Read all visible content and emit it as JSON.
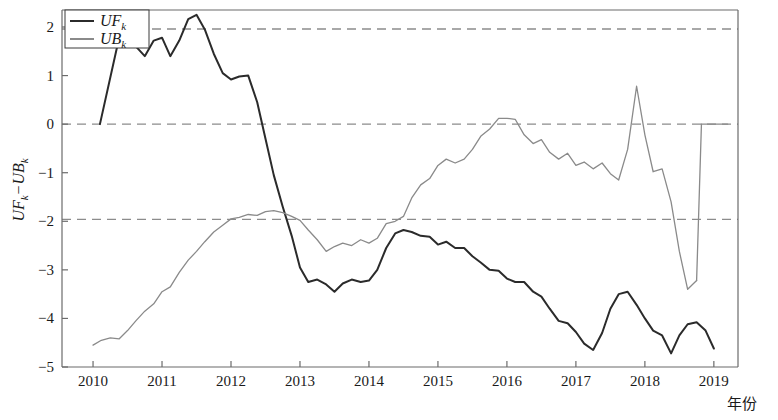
{
  "chart_data": {
    "type": "line",
    "title": "",
    "xlabel": "年份",
    "ylabel": "UFₖ−UBₖ",
    "ylabel_parts": {
      "first_main": "UF",
      "first_sub": "k",
      "dash": "−",
      "second_main": "UB",
      "second_sub": "k"
    },
    "xlim": [
      2009.55,
      2019.35
    ],
    "ylim": [
      -5,
      2.35
    ],
    "xticks": [
      2010,
      2011,
      2012,
      2013,
      2014,
      2015,
      2016,
      2017,
      2018,
      2019
    ],
    "xtick_labels": [
      "2010",
      "2011",
      "2012",
      "2013",
      "2014",
      "2015",
      "2016",
      "2017",
      "2018",
      "2019"
    ],
    "yticks": [
      2,
      1,
      0,
      -1,
      -2,
      -3,
      -4,
      -5
    ],
    "ytick_labels": [
      "2",
      "1",
      "0",
      "−1",
      "−2",
      "−3",
      "−4",
      "−5"
    ],
    "grid": false,
    "reference_lines": [
      {
        "y": 1.96,
        "style": "dashed",
        "color": "#8c8c8c",
        "label": "+1.96 significance"
      },
      {
        "y": 0,
        "style": "dashed",
        "color": "#8c8c8c",
        "label": "zero line"
      },
      {
        "y": -1.96,
        "style": "dashed",
        "color": "#8c8c8c",
        "label": "-1.96 significance"
      }
    ],
    "legend": {
      "position": "top-left",
      "entries": [
        {
          "name": "UFₖ",
          "main": "UF",
          "sub": "k",
          "color": "#2b2b2b",
          "width": 2.0
        },
        {
          "name": "UBₖ",
          "main": "UB",
          "sub": "k",
          "color": "#8a8a8a",
          "width": 1.3
        }
      ]
    },
    "series": [
      {
        "name": "UFₖ",
        "color": "#2b2b2b",
        "width": 2.0,
        "x": [
          2010.1,
          2010.35,
          2010.5,
          2010.62,
          2010.75,
          2010.88,
          2011.0,
          2011.12,
          2011.25,
          2011.38,
          2011.5,
          2011.62,
          2011.75,
          2011.88,
          2012.0,
          2012.12,
          2012.25,
          2012.38,
          2012.5,
          2012.62,
          2012.75,
          2012.88,
          2013.0,
          2013.12,
          2013.25,
          2013.38,
          2013.5,
          2013.62,
          2013.75,
          2013.88,
          2014.0,
          2014.12,
          2014.25,
          2014.38,
          2014.5,
          2014.62,
          2014.75,
          2014.88,
          2015.0,
          2015.12,
          2015.25,
          2015.38,
          2015.5,
          2015.62,
          2015.75,
          2015.88,
          2016.0,
          2016.12,
          2016.25,
          2016.38,
          2016.5,
          2016.62,
          2016.75,
          2016.88,
          2017.0,
          2017.12,
          2017.25,
          2017.38,
          2017.5,
          2017.62,
          2017.75,
          2017.88,
          2018.0,
          2018.12,
          2018.25,
          2018.38,
          2018.5,
          2018.62,
          2018.75,
          2018.88,
          2019.0
        ],
        "y": [
          0.0,
          1.6,
          2.08,
          1.6,
          1.4,
          1.72,
          1.78,
          1.4,
          1.72,
          2.16,
          2.25,
          1.95,
          1.45,
          1.05,
          0.92,
          0.98,
          1.0,
          0.45,
          -0.3,
          -1.05,
          -1.7,
          -2.3,
          -2.95,
          -3.25,
          -3.2,
          -3.3,
          -3.45,
          -3.28,
          -3.2,
          -3.25,
          -3.22,
          -3.0,
          -2.55,
          -2.25,
          -2.18,
          -2.22,
          -2.3,
          -2.32,
          -2.48,
          -2.42,
          -2.55,
          -2.55,
          -2.72,
          -2.85,
          -3.0,
          -3.02,
          -3.18,
          -3.25,
          -3.25,
          -3.45,
          -3.55,
          -3.8,
          -4.05,
          -4.1,
          -4.28,
          -4.52,
          -4.65,
          -4.3,
          -3.8,
          -3.5,
          -3.45,
          -3.72,
          -4.0,
          -4.25,
          -4.35,
          -4.72,
          -4.35,
          -4.12,
          -4.08,
          -4.25,
          -4.62
        ]
      },
      {
        "name": "UBₖ",
        "color": "#8a8a8a",
        "width": 1.3,
        "x": [
          2010.0,
          2010.12,
          2010.25,
          2010.38,
          2010.5,
          2010.62,
          2010.75,
          2010.88,
          2011.0,
          2011.12,
          2011.25,
          2011.38,
          2011.5,
          2011.62,
          2011.75,
          2011.88,
          2012.0,
          2012.12,
          2012.25,
          2012.38,
          2012.5,
          2012.62,
          2012.75,
          2012.88,
          2013.0,
          2013.12,
          2013.25,
          2013.38,
          2013.5,
          2013.62,
          2013.75,
          2013.88,
          2014.0,
          2014.12,
          2014.25,
          2014.38,
          2014.5,
          2014.62,
          2014.75,
          2014.88,
          2015.0,
          2015.12,
          2015.25,
          2015.38,
          2015.5,
          2015.62,
          2015.75,
          2015.88,
          2016.0,
          2016.12,
          2016.25,
          2016.38,
          2016.5,
          2016.62,
          2016.75,
          2016.88,
          2017.0,
          2017.12,
          2017.25,
          2017.38,
          2017.5,
          2017.62,
          2017.75,
          2017.88,
          2018.0,
          2018.12,
          2018.25,
          2018.38,
          2018.5,
          2018.62,
          2018.75
        ],
        "y": [
          -4.55,
          -4.45,
          -4.4,
          -4.42,
          -4.25,
          -4.05,
          -3.85,
          -3.7,
          -3.45,
          -3.35,
          -3.05,
          -2.8,
          -2.62,
          -2.42,
          -2.22,
          -2.08,
          -1.95,
          -1.92,
          -1.86,
          -1.88,
          -1.8,
          -1.78,
          -1.82,
          -1.9,
          -1.98,
          -2.18,
          -2.38,
          -2.62,
          -2.52,
          -2.45,
          -2.5,
          -2.38,
          -2.45,
          -2.35,
          -2.05,
          -2.0,
          -1.9,
          -1.52,
          -1.25,
          -1.12,
          -0.85,
          -0.72,
          -0.8,
          -0.72,
          -0.52,
          -0.25,
          -0.1,
          0.12,
          0.12,
          0.1,
          -0.22,
          -0.4,
          -0.32,
          -0.58,
          -0.72,
          -0.6,
          -0.85,
          -0.78,
          -0.92,
          -0.8,
          -1.02,
          -1.15,
          -0.52,
          0.78,
          -0.22,
          -0.98,
          -0.92,
          -1.6,
          -2.62,
          -3.4,
          -3.22
        ]
      },
      {
        "name": "UBₖ-tail",
        "color": "#8a8a8a",
        "width": 1.3,
        "x": [
          2018.75,
          2018.82
        ],
        "y": [
          -3.22,
          0.0
        ]
      },
      {
        "name": "UBₖ-top",
        "color": "#8a8a8a",
        "width": 1.3,
        "x": [
          2018.82,
          2019.2
        ],
        "y": [
          0.0,
          0.0
        ]
      }
    ]
  },
  "axes": {
    "spine_color": "#6b6b6b",
    "tick_color": "#6b6b6b",
    "background": "#ffffff"
  }
}
